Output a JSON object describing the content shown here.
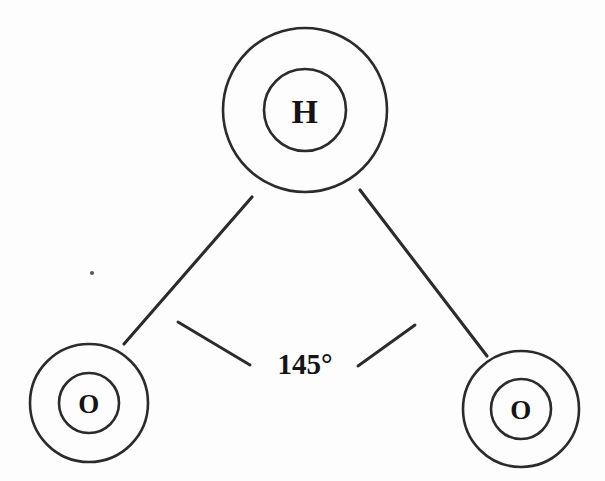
{
  "figure": {
    "background_color": "#fdfdfd",
    "stroke_color": "#2b2b2b",
    "text_color": "#141414",
    "width": 605,
    "height": 481
  },
  "atoms": [
    {
      "id": "hydrogen-top",
      "label": "H",
      "element": "H",
      "position": "top-center",
      "cx": 305,
      "cy": 110,
      "outer_r": 82,
      "inner_r": 41
    },
    {
      "id": "oxygen-left",
      "label": "O",
      "element": "O",
      "position": "bottom-left",
      "cx": 89,
      "cy": 403,
      "outer_r": 59,
      "inner_r": 30
    },
    {
      "id": "oxygen-right",
      "label": "O",
      "element": "O",
      "position": "bottom-right",
      "cx": 521,
      "cy": 409,
      "outer_r": 58,
      "inner_r": 30
    }
  ],
  "bonds": [
    {
      "id": "bond-h-o-left",
      "from": "hydrogen-top",
      "to": "oxygen-left",
      "x1": 252,
      "y1": 197,
      "x2": 124,
      "y2": 344
    },
    {
      "id": "bond-h-o-right",
      "from": "hydrogen-top",
      "to": "oxygen-right",
      "x1": 360,
      "y1": 190,
      "x2": 487,
      "y2": 356
    }
  ],
  "angle": {
    "value": "145°",
    "degrees": 145,
    "vertex_atom": "hydrogen-top",
    "label_x": 305,
    "label_y": 362,
    "ticks": [
      {
        "id": "angle-tick-left",
        "x1": 178,
        "y1": 322,
        "x2": 250,
        "y2": 365
      },
      {
        "id": "angle-tick-right",
        "x1": 415,
        "y1": 325,
        "x2": 358,
        "y2": 366
      }
    ]
  },
  "artifacts": [
    {
      "id": "scan-speck",
      "cx": 92,
      "cy": 273,
      "r": 2.1
    }
  ]
}
